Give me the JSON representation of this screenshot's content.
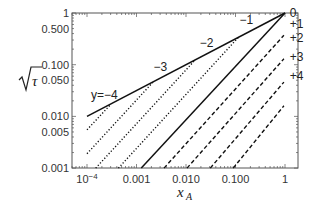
{
  "chart_data": {
    "type": "line",
    "title": "",
    "xlabel": "x_A",
    "ylabel": "√τ",
    "xscale": "log",
    "yscale": "log",
    "xlim": [
      5e-05,
      1.8
    ],
    "ylim": [
      0.001,
      1
    ],
    "grid": false,
    "legend": "none (curves labeled inline)",
    "x_ticks": [
      {
        "value": 0.0001,
        "label": "10",
        "sup": "−4"
      },
      {
        "value": 0.001,
        "label": "0.001"
      },
      {
        "value": 0.01,
        "label": "0.010"
      },
      {
        "value": 0.1,
        "label": "0.100"
      },
      {
        "value": 1,
        "label": "1"
      }
    ],
    "y_ticks": [
      {
        "value": 1,
        "label": "1"
      },
      {
        "value": 0.5,
        "label": "0.500"
      },
      {
        "value": 0.1,
        "label": "0.100"
      },
      {
        "value": 0.05,
        "label": "0.050"
      },
      {
        "value": 0.01,
        "label": "0.010"
      },
      {
        "value": 0.005,
        "label": "0.005"
      },
      {
        "value": 0.001,
        "label": "0.001"
      }
    ],
    "series": [
      {
        "name": "envelope",
        "style": "solid",
        "points": [
          [
            0.0001,
            0.01
          ],
          [
            1,
            1
          ]
        ]
      },
      {
        "name": "y=0",
        "label": "0",
        "style": "solid",
        "points": [
          [
            0.00125,
            0.001
          ],
          [
            1,
            1
          ]
        ]
      },
      {
        "name": "y=-1",
        "label": "−1",
        "style": "dotted",
        "points": [
          [
            0.00043,
            0.001
          ],
          [
            0.115,
            0.34
          ]
        ]
      },
      {
        "name": "y=-2",
        "label": "−2",
        "style": "dotted",
        "points": [
          [
            0.00015,
            0.001
          ],
          [
            0.0155,
            0.125
          ]
        ]
      },
      {
        "name": "y=-3",
        "label": "−3",
        "style": "dotted",
        "points": [
          [
            0.0001,
            0.0019
          ],
          [
            0.0022,
            0.047
          ]
        ]
      },
      {
        "name": "y=-4",
        "label": "y=−4",
        "style": "dotted",
        "points": [
          [
            0.0001,
            0.0055
          ],
          [
            0.0003,
            0.017
          ]
        ]
      },
      {
        "name": "y=+1",
        "label": "+1",
        "style": "dashed",
        "points": [
          [
            0.0036,
            0.001
          ],
          [
            0.95,
            0.37
          ]
        ]
      },
      {
        "name": "y=+2",
        "label": "+2",
        "style": "dashed",
        "points": [
          [
            0.0105,
            0.001
          ],
          [
            0.95,
            0.13
          ]
        ]
      },
      {
        "name": "y=+3",
        "label": "+3",
        "style": "dashed",
        "points": [
          [
            0.031,
            0.001
          ],
          [
            0.95,
            0.046
          ]
        ]
      },
      {
        "name": "y=+4",
        "label": "+4",
        "style": "dashed",
        "points": [
          [
            0.09,
            0.001
          ],
          [
            0.95,
            0.016
          ]
        ]
      }
    ],
    "annotations": [
      {
        "text": "y=−4",
        "x": 0.00012,
        "y": 0.022
      },
      {
        "text": "−3",
        "x": 0.0022,
        "y": 0.075
      },
      {
        "text": "−2",
        "x": 0.019,
        "y": 0.22
      },
      {
        "text": "−1",
        "x": 0.12,
        "y": 0.6
      },
      {
        "text": "0",
        "x": 1.25,
        "y": 0.82
      },
      {
        "text": "+1",
        "x": 1.25,
        "y": 0.52
      },
      {
        "text": "+2",
        "x": 1.25,
        "y": 0.28
      },
      {
        "text": "+3",
        "x": 1.25,
        "y": 0.12
      },
      {
        "text": "+4",
        "x": 1.25,
        "y": 0.05
      }
    ]
  },
  "axes": {
    "x_title": "x",
    "x_title_sub": "A",
    "y_title": "τ"
  },
  "colors": {
    "line": "#111111",
    "frame": "#555555",
    "text": "#333333"
  }
}
